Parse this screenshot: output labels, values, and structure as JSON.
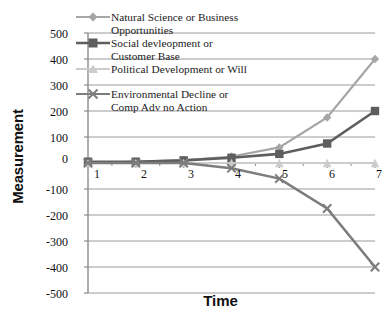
{
  "chart_data": {
    "type": "line",
    "title": "",
    "xlabel": "Time",
    "ylabel": "Measurement",
    "categories": [
      "1",
      "2",
      "3",
      "4",
      "5",
      "6",
      "7"
    ],
    "x": [
      1,
      2,
      3,
      4,
      5,
      6,
      7
    ],
    "ylim": [
      -500,
      500
    ],
    "ytick_labels": [
      "500",
      "400",
      "300",
      "200",
      "100",
      "0",
      "-100",
      "-200",
      "-300",
      "-400",
      "-500"
    ],
    "ytick_values": [
      500,
      400,
      300,
      200,
      100,
      0,
      -100,
      -200,
      -300,
      -400,
      -500
    ],
    "xtick_labels": [
      "1",
      "2",
      "3",
      "4",
      "5",
      "6",
      "7"
    ],
    "grid": "horizontal",
    "legend_position": "upper-left-overlay",
    "series": [
      {
        "name": "Natural Science or Business Opportunities",
        "name_line1": "Natural Science or Business",
        "name_line2": "Opportunities",
        "marker": "diamond",
        "color": "#a6a6a6",
        "values": [
          0,
          5,
          10,
          25,
          60,
          175,
          400
        ]
      },
      {
        "name": "Social devleopment or Customer Base",
        "name_line1": "Social devleopment or",
        "name_line2": "Customer Base",
        "marker": "square",
        "color": "#5e5e5e",
        "values": [
          5,
          5,
          10,
          20,
          35,
          75,
          200
        ]
      },
      {
        "name": "Political Development or Will",
        "name_line1": "Political Development or Will",
        "name_line2": "",
        "marker": "triangle",
        "color": "#cccccc",
        "values": [
          0,
          0,
          0,
          0,
          0,
          0,
          0
        ]
      },
      {
        "name": "Environmental Decline or Comp Adv no Action",
        "name_line1": "Environmental Decline or",
        "name_line2": "Comp Adv no Action",
        "marker": "x",
        "color": "#7d7d7d",
        "values": [
          0,
          0,
          0,
          -20,
          -60,
          -175,
          -400
        ]
      }
    ],
    "gridline_color": "#9a9a9a",
    "axis_color": "#8c8c8c",
    "background": "#ffffff"
  },
  "axes": {
    "y_title": "Measurement",
    "x_title": "Time"
  }
}
